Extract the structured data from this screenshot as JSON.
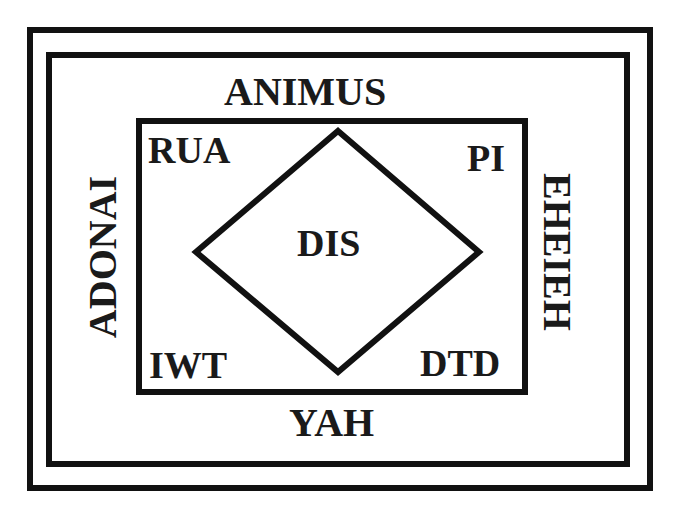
{
  "diagram": {
    "outer_frame": "outer-border",
    "top_label": "ANIMUS",
    "bottom_label": "YAH",
    "left_label": "ADONAI",
    "right_label": "EHEIEH",
    "inner": {
      "top_left": "RUA",
      "top_right": "PI",
      "bottom_left": "IWT",
      "bottom_right": "DTD",
      "center": "DIS"
    },
    "colors": {
      "stroke": "#111111",
      "text": "#1a1a1a",
      "background": "#ffffff"
    }
  }
}
